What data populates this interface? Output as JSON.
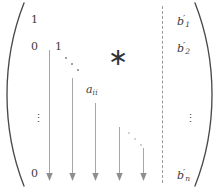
{
  "figure": {
    "kind": "augmented-matrix",
    "ink_color": "#3d3d3d",
    "divider_color": "#9a9a9a",
    "arrow_color": "#9b9b9b",
    "dots_color": "#8d8d8d"
  },
  "brackets": {
    "left": "(",
    "right": ")"
  },
  "divider": {
    "style": "dashed",
    "orientation": "vertical"
  },
  "coefficient_entries": [
    {
      "name": "entry-1-1",
      "text": "1",
      "kind": "number",
      "x": 31,
      "y": 14
    },
    {
      "name": "entry-2-1",
      "text": "0",
      "kind": "number",
      "x": 31,
      "y": 41
    },
    {
      "name": "entry-2-2",
      "text": "1",
      "kind": "number",
      "x": 55,
      "y": 41
    },
    {
      "name": "entry-n-1",
      "text": "0",
      "kind": "number",
      "x": 31,
      "y": 168
    }
  ],
  "diagonal_label": {
    "name": "entry-a-ii",
    "base": "a",
    "subscript": "ii",
    "text": "a_ii",
    "x": 86,
    "y": 84
  },
  "asterisk": {
    "name": "upper-triangle-asterisk",
    "text": "∗",
    "meaning": "arbitrary nonzero entries above the diagonal",
    "x": 108,
    "y": 52
  },
  "ellipses": [
    {
      "name": "ddots-upper",
      "symbol": "⋱",
      "x": 64,
      "y": 56,
      "faint": false
    },
    {
      "name": "ddots-lower",
      "symbol": "⋱",
      "x": 127,
      "y": 131,
      "faint": true
    },
    {
      "name": "vdots-left",
      "symbol": "⋮",
      "x": 33,
      "y": 118
    },
    {
      "name": "vdots-right",
      "symbol": "⋮",
      "x": 185,
      "y": 118
    }
  ],
  "constant_column": [
    {
      "name": "constant-b1",
      "base": "b",
      "prime": "′",
      "subscript": "1",
      "text": "b'_1",
      "x": 177,
      "y": 14
    },
    {
      "name": "constant-b2",
      "base": "b",
      "prime": "′",
      "subscript": "2",
      "text": "b'_2",
      "x": 177,
      "y": 41
    },
    {
      "name": "constant-bn",
      "base": "b",
      "prime": "′",
      "subscript": "n",
      "text": "b'_n",
      "x": 177,
      "y": 168
    }
  ],
  "arrows": {
    "count": 5,
    "direction": "down",
    "items": [
      {
        "name": "arrow-column-1",
        "x": 49,
        "y_start": 50,
        "y_end": 181
      },
      {
        "name": "arrow-column-2",
        "x": 72,
        "y_start": 78,
        "y_end": 181
      },
      {
        "name": "arrow-column-3",
        "x": 95,
        "y_start": 103,
        "y_end": 181
      },
      {
        "name": "arrow-column-4",
        "x": 119,
        "y_start": 127,
        "y_end": 181
      },
      {
        "name": "arrow-column-5",
        "x": 143,
        "y_start": 148,
        "y_end": 181
      }
    ]
  }
}
